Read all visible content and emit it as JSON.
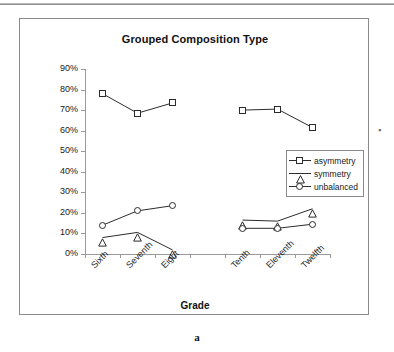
{
  "figure": {
    "caption": "a",
    "annotation_mark": "▪"
  },
  "chart_data": {
    "type": "line",
    "title": "Grouped Composition Type",
    "xlabel": "Grade",
    "ylabel": "",
    "categories": [
      "Sixth",
      "Seventh",
      "Eight",
      "",
      "Tenth",
      "Eleventh",
      "Twelfth"
    ],
    "ytick_labels": [
      "0%",
      "10%",
      "20%",
      "30%",
      "40%",
      "50%",
      "60%",
      "70%",
      "80%",
      "90%"
    ],
    "ytick_values": [
      0,
      10,
      20,
      30,
      40,
      50,
      60,
      70,
      80,
      90
    ],
    "ylim": [
      0,
      90
    ],
    "grid": false,
    "legend_position": "right-center",
    "series": [
      {
        "name": "asymmetry",
        "marker": "square",
        "values": [
          78,
          68.5,
          73.5,
          null,
          70,
          70.5,
          61.5
        ]
      },
      {
        "name": "symmetry",
        "marker": "triangle",
        "values": [
          8,
          10.5,
          2,
          null,
          16.5,
          16,
          22
        ]
      },
      {
        "name": "unbalanced",
        "marker": "circle",
        "values": [
          14,
          21,
          23.5,
          null,
          12.5,
          12.5,
          14.5
        ]
      }
    ],
    "colors": {
      "line": "#2b2b2b",
      "axis": "#9a9a9a",
      "text": "#1a1a1a",
      "frame": "#8a8a8a",
      "background": "#ffffff"
    }
  }
}
